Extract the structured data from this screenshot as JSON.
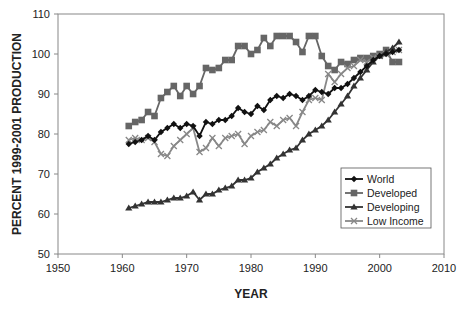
{
  "chart_data": {
    "type": "line",
    "title": "",
    "xlabel": "YEAR",
    "ylabel": "PERCENT 1999-2001 PRODUCTION",
    "xlim": [
      1950,
      2010
    ],
    "ylim": [
      50,
      110
    ],
    "xticks": [
      1950,
      1960,
      1970,
      1980,
      1990,
      2000,
      2010
    ],
    "yticks": [
      50,
      60,
      70,
      80,
      90,
      100,
      110
    ],
    "grid": false,
    "legend_position": "lower right (inside plot)",
    "x": [
      1961,
      1962,
      1963,
      1964,
      1965,
      1966,
      1967,
      1968,
      1969,
      1970,
      1971,
      1972,
      1973,
      1974,
      1975,
      1976,
      1977,
      1978,
      1979,
      1980,
      1981,
      1982,
      1983,
      1984,
      1985,
      1986,
      1987,
      1988,
      1989,
      1990,
      1991,
      1992,
      1993,
      1994,
      1995,
      1996,
      1997,
      1998,
      1999,
      2000,
      2001,
      2002,
      2003
    ],
    "series": [
      {
        "name": "World",
        "marker": "diamond",
        "color": "#111111",
        "values": [
          77.5,
          78,
          78.5,
          79.5,
          78.5,
          80.5,
          81.5,
          82.5,
          81.5,
          82.5,
          82,
          79.5,
          83,
          82.5,
          83.5,
          83.5,
          84.5,
          86.5,
          85.5,
          85,
          87,
          86,
          88.5,
          89.5,
          89,
          90,
          89.5,
          88.5,
          89.5,
          91,
          90.5,
          90,
          91.5,
          91.5,
          92.5,
          94,
          95.5,
          97,
          98.5,
          99.5,
          100,
          100.5,
          101
        ]
      },
      {
        "name": "Developed",
        "marker": "square",
        "color": "#666666",
        "values": [
          82,
          83,
          83.5,
          85.5,
          84.5,
          89,
          90.5,
          92,
          89.5,
          92,
          90,
          92,
          96.5,
          96,
          96.5,
          98.5,
          98.5,
          102,
          102,
          100,
          101,
          104,
          102,
          104.5,
          104.5,
          104.5,
          103,
          100.5,
          104.5,
          104.5,
          99.5,
          97,
          96,
          98,
          97.5,
          98.5,
          99,
          99,
          99.5,
          100,
          101,
          98,
          98
        ]
      },
      {
        "name": "Developing",
        "marker": "triangle",
        "color": "#333333",
        "values": [
          61.5,
          62,
          62.5,
          63,
          63,
          63,
          63.5,
          64,
          64,
          64.5,
          65.5,
          63.5,
          65,
          65,
          66,
          66.5,
          67,
          68.5,
          68.5,
          69,
          70.5,
          71.5,
          72.5,
          74,
          75,
          76,
          76.5,
          78.5,
          80,
          81,
          82,
          83.5,
          85.5,
          87.5,
          89.5,
          92,
          94,
          96,
          98,
          99.5,
          100.5,
          101.5,
          103
        ]
      },
      {
        "name": "Low Income",
        "marker": "x",
        "color": "#888888",
        "values": [
          78.5,
          79,
          78.5,
          79,
          78,
          75,
          74.5,
          77,
          78.5,
          80,
          81.5,
          75.5,
          76.5,
          79,
          77,
          79,
          79.5,
          80,
          77.5,
          79.5,
          80.5,
          81,
          83,
          82,
          83.5,
          84,
          82,
          85.5,
          88.5,
          89,
          88.5,
          95,
          93,
          95,
          96.5,
          97,
          98.5,
          98,
          99,
          99.5,
          100,
          100.5,
          101
        ]
      }
    ]
  },
  "legend": {
    "items": [
      {
        "label": "World"
      },
      {
        "label": "Developed"
      },
      {
        "label": "Developing"
      },
      {
        "label": "Low Income"
      }
    ]
  },
  "axes": {
    "x_title": "YEAR",
    "y_title": "PERCENT 1999-2001 PRODUCTION"
  }
}
